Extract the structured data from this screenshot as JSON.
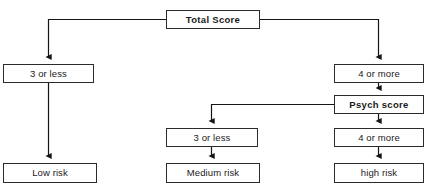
{
  "diagram": {
    "type": "flowchart",
    "stroke_color": "#2b2b2b",
    "background_color": "#ffffff",
    "text_color": "#1a1a1a",
    "nodes": [
      {
        "id": "total_score",
        "label": "Total Score",
        "bold": true,
        "x": 166,
        "y": 10,
        "w": 94,
        "h": 19
      },
      {
        "id": "left_3_or_less",
        "label": "3 or less",
        "bold": false,
        "x": 3,
        "y": 64,
        "w": 91,
        "h": 19
      },
      {
        "id": "right_4_or_more",
        "label": "4 or more",
        "bold": false,
        "x": 334,
        "y": 64,
        "w": 90,
        "h": 19
      },
      {
        "id": "psych_score",
        "label": "Psych score",
        "bold": true,
        "x": 334,
        "y": 95,
        "w": 90,
        "h": 19
      },
      {
        "id": "mid_3_or_less",
        "label": "3 or less",
        "bold": false,
        "x": 166,
        "y": 128,
        "w": 92,
        "h": 19
      },
      {
        "id": "psych_4_or_more",
        "label": "4 or more",
        "bold": false,
        "x": 334,
        "y": 128,
        "w": 90,
        "h": 19
      },
      {
        "id": "low_risk",
        "label": "Low risk",
        "bold": false,
        "x": 3,
        "y": 163,
        "w": 94,
        "h": 20
      },
      {
        "id": "medium_risk",
        "label": "Medium risk",
        "bold": false,
        "x": 166,
        "y": 163,
        "w": 94,
        "h": 20
      },
      {
        "id": "high_risk",
        "label": "high risk",
        "bold": false,
        "x": 334,
        "y": 163,
        "w": 90,
        "h": 20
      }
    ],
    "edges": [
      {
        "id": "total-to-left",
        "from": "total_score",
        "to": "left_3_or_less"
      },
      {
        "id": "total-to-right",
        "from": "total_score",
        "to": "right_4_or_more"
      },
      {
        "id": "left-to-low",
        "from": "left_3_or_less",
        "to": "low_risk"
      },
      {
        "id": "right4-to-psych",
        "from": "right_4_or_more",
        "to": "psych_score"
      },
      {
        "id": "psych-to-mid3",
        "from": "psych_score",
        "to": "mid_3_or_less"
      },
      {
        "id": "psych-to-psych4",
        "from": "psych_score",
        "to": "psych_4_or_more"
      },
      {
        "id": "mid3-to-medium",
        "from": "mid_3_or_less",
        "to": "medium_risk"
      },
      {
        "id": "psych4-to-high",
        "from": "psych_4_or_more",
        "to": "high_risk"
      }
    ]
  }
}
